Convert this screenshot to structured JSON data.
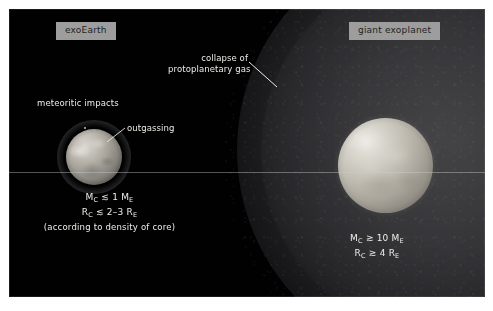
{
  "figure": {
    "kind": "astronomy-diagram",
    "background_color": "#010101",
    "page_color": "#ffffff",
    "annotation_text_color": "#eceae4",
    "chip_background_color": "#9d9d9d",
    "chip_text_color": "#1f1f1f"
  },
  "chips": {
    "left": "exoEarth",
    "right": "giant exoplanet"
  },
  "annotations": {
    "meteoritic_impacts": "meteoritic impacts",
    "outgassing": "outgassing",
    "collapse_line1": "collapse of",
    "collapse_line2": "protoplanetary gas"
  },
  "formulas": {
    "exoearth": {
      "mass_symbol": "M",
      "mass_sub": "C",
      "mass_relation": " ≲ 1 M",
      "mass_unit_sub": "E",
      "radius_symbol": "R",
      "radius_sub": "C",
      "radius_relation": " ≲ 2–3 R",
      "radius_unit_sub": "E",
      "note": "(according to density of core)"
    },
    "giant": {
      "mass_symbol": "M",
      "mass_sub": "C",
      "mass_relation": " ≳ 10 M",
      "mass_unit_sub": "E",
      "radius_symbol": "R",
      "radius_sub": "C",
      "radius_relation": " ≳ 4 R",
      "radius_unit_sub": "E"
    }
  },
  "objects": {
    "exoearth_core_label": "rocky core with thin atmosphere",
    "giant_core_label": "giant planet core",
    "gas_envelope_label": "collapsing protoplanetary gas envelope"
  }
}
